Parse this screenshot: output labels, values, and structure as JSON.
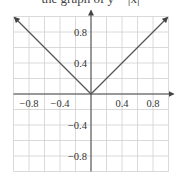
{
  "caption_fragment": "the graph of y = |x|",
  "chart_data": {
    "type": "line",
    "title": "",
    "xlabel": "",
    "ylabel": "",
    "xlim": [
      -1.0,
      1.0
    ],
    "ylim": [
      -1.0,
      1.0
    ],
    "grid": true,
    "grid_step": 0.2,
    "x_ticks": [
      "−0.8",
      "−0.4",
      "0.4",
      "0.8"
    ],
    "y_ticks": [
      "0.8",
      "0.4",
      "−0.4",
      "−0.8"
    ],
    "series": [
      {
        "name": "y = |x|",
        "x": [
          -1.0,
          -0.8,
          -0.6,
          -0.4,
          -0.2,
          0.0,
          0.2,
          0.4,
          0.6,
          0.8,
          1.0
        ],
        "y": [
          1.0,
          0.8,
          0.6,
          0.4,
          0.2,
          0.0,
          0.2,
          0.4,
          0.6,
          0.8,
          1.0
        ],
        "arrows_at_ends": true
      }
    ]
  },
  "colors": {
    "grid": "#d0d0d0",
    "axis": "#444444",
    "curve": "#555555",
    "text": "#333333"
  }
}
